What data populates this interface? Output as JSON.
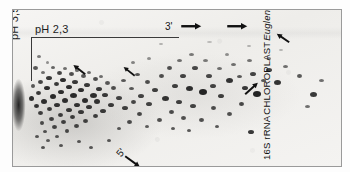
{
  "figure": {
    "kind": "two-dimensional-electrophoresis-autoradiogram",
    "background_color": "#ffffff",
    "film_color": "#f2f1ef",
    "spot_color": "#1a1a1a",
    "frame_color": "#9a9a9a"
  },
  "axes": {
    "top_label": "pH 2,3",
    "left_label": "pH 3,5",
    "line_color": "#3a3a3a"
  },
  "direction_markers": {
    "three_prime": "3'",
    "five_prime": "5'"
  },
  "caption": {
    "line1": "16S rRNA",
    "line2": "CHLOROPLAST",
    "line3": "Euglena"
  },
  "arrows": [
    {
      "name": "arrow-3prime-top",
      "x": 168,
      "y": 16,
      "angle": 0,
      "length": 20,
      "width": 2.4
    },
    {
      "name": "arrow-top-middle",
      "x": 214,
      "y": 16,
      "angle": 0,
      "length": 20,
      "width": 2.4
    },
    {
      "name": "arrow-top-right",
      "x": 276,
      "y": 32,
      "angle": 214,
      "length": 15,
      "width": 2.0
    },
    {
      "name": "arrow-left-cluster",
      "x": 72,
      "y": 64,
      "angle": 218,
      "length": 15,
      "width": 2.0
    },
    {
      "name": "arrow-mid-cluster",
      "x": 122,
      "y": 66,
      "angle": 218,
      "length": 14,
      "width": 1.8
    },
    {
      "name": "arrow-right-up",
      "x": 232,
      "y": 84,
      "angle": 318,
      "length": 17,
      "width": 2.0
    },
    {
      "name": "arrow-5prime",
      "x": 112,
      "y": 146,
      "angle": 36,
      "length": 18,
      "width": 2.0
    }
  ],
  "spots": [
    {
      "x": 26,
      "y": 46,
      "w": 4,
      "h": 3,
      "o": 0.55
    },
    {
      "x": 34,
      "y": 52,
      "w": 3,
      "h": 3,
      "o": 0.45
    },
    {
      "x": 22,
      "y": 58,
      "w": 5,
      "h": 4,
      "o": 0.7
    },
    {
      "x": 30,
      "y": 62,
      "w": 4,
      "h": 3,
      "o": 0.6
    },
    {
      "x": 40,
      "y": 57,
      "w": 4,
      "h": 3,
      "o": 0.65
    },
    {
      "x": 46,
      "y": 63,
      "w": 5,
      "h": 4,
      "o": 0.8
    },
    {
      "x": 36,
      "y": 68,
      "w": 6,
      "h": 4,
      "o": 0.85
    },
    {
      "x": 27,
      "y": 72,
      "w": 5,
      "h": 4,
      "o": 0.8
    },
    {
      "x": 20,
      "y": 76,
      "w": 4,
      "h": 4,
      "o": 0.7
    },
    {
      "x": 52,
      "y": 58,
      "w": 4,
      "h": 3,
      "o": 0.6
    },
    {
      "x": 58,
      "y": 64,
      "w": 5,
      "h": 4,
      "o": 0.75
    },
    {
      "x": 50,
      "y": 70,
      "w": 6,
      "h": 4,
      "o": 0.9
    },
    {
      "x": 43,
      "y": 74,
      "w": 5,
      "h": 4,
      "o": 0.85
    },
    {
      "x": 34,
      "y": 78,
      "w": 6,
      "h": 4,
      "o": 0.9
    },
    {
      "x": 25,
      "y": 83,
      "w": 5,
      "h": 4,
      "o": 0.85
    },
    {
      "x": 18,
      "y": 88,
      "w": 5,
      "h": 5,
      "o": 0.9
    },
    {
      "x": 64,
      "y": 60,
      "w": 4,
      "h": 3,
      "o": 0.6
    },
    {
      "x": 70,
      "y": 66,
      "w": 5,
      "h": 4,
      "o": 0.7
    },
    {
      "x": 62,
      "y": 72,
      "w": 6,
      "h": 4,
      "o": 0.85
    },
    {
      "x": 56,
      "y": 77,
      "w": 6,
      "h": 4,
      "o": 0.9
    },
    {
      "x": 48,
      "y": 82,
      "w": 6,
      "h": 4,
      "o": 0.9
    },
    {
      "x": 40,
      "y": 86,
      "w": 6,
      "h": 5,
      "o": 0.92
    },
    {
      "x": 31,
      "y": 91,
      "w": 6,
      "h": 5,
      "o": 0.9
    },
    {
      "x": 23,
      "y": 96,
      "w": 5,
      "h": 4,
      "o": 0.88
    },
    {
      "x": 76,
      "y": 62,
      "w": 4,
      "h": 3,
      "o": 0.6
    },
    {
      "x": 82,
      "y": 69,
      "w": 5,
      "h": 4,
      "o": 0.75
    },
    {
      "x": 74,
      "y": 75,
      "w": 6,
      "h": 4,
      "o": 0.85
    },
    {
      "x": 68,
      "y": 80,
      "w": 6,
      "h": 4,
      "o": 0.9
    },
    {
      "x": 60,
      "y": 85,
      "w": 7,
      "h": 5,
      "o": 0.92
    },
    {
      "x": 52,
      "y": 90,
      "w": 6,
      "h": 5,
      "o": 0.9
    },
    {
      "x": 44,
      "y": 95,
      "w": 6,
      "h": 4,
      "o": 0.88
    },
    {
      "x": 36,
      "y": 99,
      "w": 5,
      "h": 4,
      "o": 0.85
    },
    {
      "x": 27,
      "y": 103,
      "w": 5,
      "h": 4,
      "o": 0.82
    },
    {
      "x": 88,
      "y": 66,
      "w": 4,
      "h": 3,
      "o": 0.6
    },
    {
      "x": 94,
      "y": 73,
      "w": 5,
      "h": 4,
      "o": 0.7
    },
    {
      "x": 86,
      "y": 79,
      "w": 6,
      "h": 4,
      "o": 0.85
    },
    {
      "x": 80,
      "y": 85,
      "w": 7,
      "h": 5,
      "o": 0.9
    },
    {
      "x": 72,
      "y": 90,
      "w": 6,
      "h": 5,
      "o": 0.9
    },
    {
      "x": 64,
      "y": 95,
      "w": 6,
      "h": 4,
      "o": 0.88
    },
    {
      "x": 56,
      "y": 100,
      "w": 6,
      "h": 4,
      "o": 0.85
    },
    {
      "x": 47,
      "y": 105,
      "w": 5,
      "h": 4,
      "o": 0.82
    },
    {
      "x": 38,
      "y": 109,
      "w": 5,
      "h": 4,
      "o": 0.8
    },
    {
      "x": 29,
      "y": 113,
      "w": 4,
      "h": 4,
      "o": 0.75
    },
    {
      "x": 100,
      "y": 78,
      "w": 5,
      "h": 4,
      "o": 0.75
    },
    {
      "x": 92,
      "y": 85,
      "w": 6,
      "h": 4,
      "o": 0.85
    },
    {
      "x": 84,
      "y": 91,
      "w": 6,
      "h": 5,
      "o": 0.88
    },
    {
      "x": 76,
      "y": 97,
      "w": 6,
      "h": 4,
      "o": 0.86
    },
    {
      "x": 68,
      "y": 102,
      "w": 6,
      "h": 4,
      "o": 0.84
    },
    {
      "x": 59,
      "y": 107,
      "w": 5,
      "h": 4,
      "o": 0.82
    },
    {
      "x": 50,
      "y": 112,
      "w": 5,
      "h": 4,
      "o": 0.8
    },
    {
      "x": 41,
      "y": 117,
      "w": 5,
      "h": 4,
      "o": 0.78
    },
    {
      "x": 32,
      "y": 121,
      "w": 4,
      "h": 3,
      "o": 0.72
    },
    {
      "x": 106,
      "y": 88,
      "w": 6,
      "h": 4,
      "o": 0.8
    },
    {
      "x": 98,
      "y": 95,
      "w": 6,
      "h": 4,
      "o": 0.84
    },
    {
      "x": 90,
      "y": 101,
      "w": 6,
      "h": 4,
      "o": 0.84
    },
    {
      "x": 82,
      "y": 106,
      "w": 5,
      "h": 4,
      "o": 0.82
    },
    {
      "x": 72,
      "y": 111,
      "w": 5,
      "h": 4,
      "o": 0.8
    },
    {
      "x": 63,
      "y": 116,
      "w": 5,
      "h": 4,
      "o": 0.78
    },
    {
      "x": 54,
      "y": 121,
      "w": 4,
      "h": 4,
      "o": 0.76
    },
    {
      "x": 44,
      "y": 126,
      "w": 4,
      "h": 3,
      "o": 0.7
    },
    {
      "x": 35,
      "y": 130,
      "w": 4,
      "h": 3,
      "o": 0.68
    },
    {
      "x": 24,
      "y": 126,
      "w": 4,
      "h": 3,
      "o": 0.7
    },
    {
      "x": 30,
      "y": 137,
      "w": 4,
      "h": 3,
      "o": 0.72
    },
    {
      "x": 48,
      "y": 135,
      "w": 4,
      "h": 3,
      "o": 0.7
    },
    {
      "x": 66,
      "y": 131,
      "w": 4,
      "h": 3,
      "o": 0.7
    },
    {
      "x": 78,
      "y": 137,
      "w": 4,
      "h": 3,
      "o": 0.7
    },
    {
      "x": 96,
      "y": 130,
      "w": 4,
      "h": 3,
      "o": 0.7
    },
    {
      "x": 112,
      "y": 98,
      "w": 6,
      "h": 4,
      "o": 0.82
    },
    {
      "x": 120,
      "y": 92,
      "w": 5,
      "h": 4,
      "o": 0.78
    },
    {
      "x": 128,
      "y": 86,
      "w": 6,
      "h": 4,
      "o": 0.8
    },
    {
      "x": 118,
      "y": 78,
      "w": 5,
      "h": 3,
      "o": 0.7
    },
    {
      "x": 110,
      "y": 70,
      "w": 5,
      "h": 3,
      "o": 0.7
    },
    {
      "x": 124,
      "y": 64,
      "w": 5,
      "h": 3,
      "o": 0.72
    },
    {
      "x": 134,
      "y": 72,
      "w": 5,
      "h": 4,
      "o": 0.75
    },
    {
      "x": 142,
      "y": 80,
      "w": 6,
      "h": 4,
      "o": 0.82
    },
    {
      "x": 136,
      "y": 94,
      "w": 6,
      "h": 4,
      "o": 0.8
    },
    {
      "x": 126,
      "y": 104,
      "w": 5,
      "h": 4,
      "o": 0.78
    },
    {
      "x": 116,
      "y": 112,
      "w": 5,
      "h": 4,
      "o": 0.76
    },
    {
      "x": 106,
      "y": 118,
      "w": 4,
      "h": 3,
      "o": 0.7
    },
    {
      "x": 148,
      "y": 66,
      "w": 5,
      "h": 4,
      "o": 0.75
    },
    {
      "x": 156,
      "y": 58,
      "w": 5,
      "h": 4,
      "o": 0.75
    },
    {
      "x": 152,
      "y": 88,
      "w": 7,
      "h": 5,
      "o": 0.88
    },
    {
      "x": 162,
      "y": 76,
      "w": 6,
      "h": 4,
      "o": 0.82
    },
    {
      "x": 170,
      "y": 66,
      "w": 6,
      "h": 4,
      "o": 0.8
    },
    {
      "x": 166,
      "y": 50,
      "w": 5,
      "h": 3,
      "o": 0.6
    },
    {
      "x": 178,
      "y": 44,
      "w": 5,
      "h": 3,
      "o": 0.55
    },
    {
      "x": 182,
      "y": 58,
      "w": 6,
      "h": 4,
      "o": 0.78
    },
    {
      "x": 176,
      "y": 78,
      "w": 7,
      "h": 5,
      "o": 0.9
    },
    {
      "x": 166,
      "y": 92,
      "w": 6,
      "h": 4,
      "o": 0.82
    },
    {
      "x": 158,
      "y": 102,
      "w": 5,
      "h": 4,
      "o": 0.76
    },
    {
      "x": 146,
      "y": 110,
      "w": 5,
      "h": 4,
      "o": 0.74
    },
    {
      "x": 134,
      "y": 116,
      "w": 4,
      "h": 3,
      "o": 0.68
    },
    {
      "x": 192,
      "y": 50,
      "w": 5,
      "h": 3,
      "o": 0.55
    },
    {
      "x": 196,
      "y": 66,
      "w": 6,
      "h": 4,
      "o": 0.78
    },
    {
      "x": 190,
      "y": 82,
      "w": 8,
      "h": 6,
      "o": 0.95
    },
    {
      "x": 200,
      "y": 76,
      "w": 6,
      "h": 4,
      "o": 0.8
    },
    {
      "x": 206,
      "y": 58,
      "w": 5,
      "h": 3,
      "o": 0.6
    },
    {
      "x": 180,
      "y": 96,
      "w": 6,
      "h": 4,
      "o": 0.8
    },
    {
      "x": 170,
      "y": 108,
      "w": 5,
      "h": 4,
      "o": 0.74
    },
    {
      "x": 160,
      "y": 118,
      "w": 4,
      "h": 3,
      "o": 0.7
    },
    {
      "x": 214,
      "y": 44,
      "w": 4,
      "h": 3,
      "o": 0.45
    },
    {
      "x": 220,
      "y": 54,
      "w": 5,
      "h": 3,
      "o": 0.6
    },
    {
      "x": 216,
      "y": 70,
      "w": 7,
      "h": 5,
      "o": 0.88
    },
    {
      "x": 226,
      "y": 66,
      "w": 5,
      "h": 3,
      "o": 0.7
    },
    {
      "x": 208,
      "y": 86,
      "w": 6,
      "h": 4,
      "o": 0.82
    },
    {
      "x": 200,
      "y": 98,
      "w": 5,
      "h": 4,
      "o": 0.76
    },
    {
      "x": 188,
      "y": 110,
      "w": 5,
      "h": 4,
      "o": 0.74
    },
    {
      "x": 176,
      "y": 120,
      "w": 4,
      "h": 3,
      "o": 0.7
    },
    {
      "x": 236,
      "y": 50,
      "w": 5,
      "h": 3,
      "o": 0.58
    },
    {
      "x": 240,
      "y": 64,
      "w": 6,
      "h": 4,
      "o": 0.8
    },
    {
      "x": 232,
      "y": 78,
      "w": 6,
      "h": 4,
      "o": 0.85
    },
    {
      "x": 244,
      "y": 84,
      "w": 8,
      "h": 6,
      "o": 0.95
    },
    {
      "x": 228,
      "y": 94,
      "w": 5,
      "h": 4,
      "o": 0.78
    },
    {
      "x": 216,
      "y": 104,
      "w": 5,
      "h": 4,
      "o": 0.74
    },
    {
      "x": 204,
      "y": 116,
      "w": 4,
      "h": 3,
      "o": 0.7
    },
    {
      "x": 238,
      "y": 122,
      "w": 6,
      "h": 4,
      "o": 0.85
    },
    {
      "x": 256,
      "y": 60,
      "w": 6,
      "h": 4,
      "o": 0.8
    },
    {
      "x": 264,
      "y": 72,
      "w": 7,
      "h": 5,
      "o": 0.88
    },
    {
      "x": 250,
      "y": 70,
      "w": 5,
      "h": 3,
      "o": 0.7
    },
    {
      "x": 256,
      "y": 48,
      "w": 4,
      "h": 3,
      "o": 0.5
    },
    {
      "x": 272,
      "y": 56,
      "w": 5,
      "h": 3,
      "o": 0.6
    },
    {
      "x": 286,
      "y": 66,
      "w": 5,
      "h": 4,
      "o": 0.7
    },
    {
      "x": 300,
      "y": 84,
      "w": 7,
      "h": 5,
      "o": 0.85
    },
    {
      "x": 308,
      "y": 70,
      "w": 5,
      "h": 3,
      "o": 0.6
    },
    {
      "x": 294,
      "y": 96,
      "w": 5,
      "h": 3,
      "o": 0.6
    },
    {
      "x": 148,
      "y": 34,
      "w": 4,
      "h": 2,
      "o": 0.3
    },
    {
      "x": 196,
      "y": 32,
      "w": 5,
      "h": 2,
      "o": 0.25
    },
    {
      "x": 236,
      "y": 36,
      "w": 4,
      "h": 2,
      "o": 0.3
    },
    {
      "x": 268,
      "y": 40,
      "w": 4,
      "h": 2,
      "o": 0.28
    },
    {
      "x": 120,
      "y": 52,
      "w": 4,
      "h": 3,
      "o": 0.5
    },
    {
      "x": 136,
      "y": 48,
      "w": 4,
      "h": 3,
      "o": 0.45
    }
  ]
}
